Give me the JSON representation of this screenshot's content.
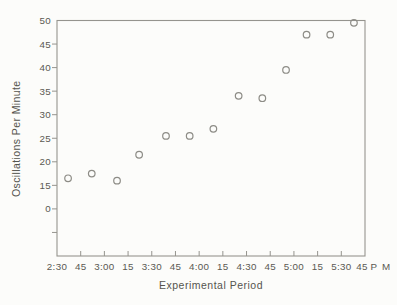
{
  "figure": {
    "background": "#fcfcfa",
    "line_color": "#95948e",
    "text_color": "#55544e",
    "point_stroke_color": "#8d8c86"
  },
  "chart_data": {
    "type": "scatter",
    "title": "",
    "xlabel": "Experimental Period",
    "ylabel": "Oscillations Per Minute",
    "legend": "none",
    "grid": "off",
    "marker": "open-circle",
    "x_axis": {
      "tick_labels": [
        "2:30",
        "45",
        "3:00",
        "15",
        "3:30",
        "45",
        "4:00",
        "15",
        "4:30",
        "45",
        "5:00",
        "15",
        "5:30",
        "45"
      ],
      "suffix_label": "P M",
      "start_minutes": 150,
      "end_minutes": 345,
      "interval_minutes": 15
    },
    "y_axis": {
      "tick_labels": [
        "50",
        "45",
        "40",
        "35",
        "30",
        "25",
        "20",
        "15",
        "0",
        ""
      ],
      "top_value": 50,
      "unit_per_tick": 5,
      "units_top_to_bottom": 10,
      "note": "suppressed-zero scale: the '0' label sits at the 10 position with one unlabeled tick below it"
    },
    "points": [
      {
        "time": "2:37",
        "minutes": 157,
        "value": 16.5
      },
      {
        "time": "2:52",
        "minutes": 172,
        "value": 17.5
      },
      {
        "time": "3:08",
        "minutes": 188,
        "value": 16
      },
      {
        "time": "3:22",
        "minutes": 202,
        "value": 21.5
      },
      {
        "time": "3:39",
        "minutes": 219,
        "value": 25.5
      },
      {
        "time": "3:54",
        "minutes": 234,
        "value": 25.5
      },
      {
        "time": "4:09",
        "minutes": 249,
        "value": 27
      },
      {
        "time": "4:25",
        "minutes": 265,
        "value": 34
      },
      {
        "time": "4:40",
        "minutes": 280,
        "value": 33.5
      },
      {
        "time": "4:55",
        "minutes": 295,
        "value": 39.5
      },
      {
        "time": "5:08",
        "minutes": 308,
        "value": 47
      },
      {
        "time": "5:23",
        "minutes": 323,
        "value": 47
      },
      {
        "time": "5:38",
        "minutes": 338,
        "value": 49.5
      }
    ]
  }
}
